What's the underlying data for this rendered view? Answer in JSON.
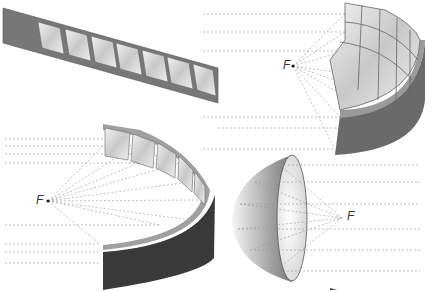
{
  "diagram": {
    "panels": [
      {
        "id": "flat-strip",
        "name": "Flat mirror strip with 7 mirror segments",
        "segments": 7
      },
      {
        "id": "cylindrical-multi-row",
        "name": "Curved multi-row mirror array focusing to F",
        "focus_label": "F"
      },
      {
        "id": "cylindrical-single-row",
        "name": "Curved single-row mirror focusing to F",
        "focus_label": "F"
      },
      {
        "id": "paraboloid-dish",
        "name": "Paraboloid dish reflecting parallel rays to F",
        "focus_label": "F"
      }
    ],
    "colors": {
      "frame": "#7a7a7a",
      "mirror": "#d8d8d8",
      "dark_band": "#3a3a3a",
      "ray": "#888888"
    }
  }
}
